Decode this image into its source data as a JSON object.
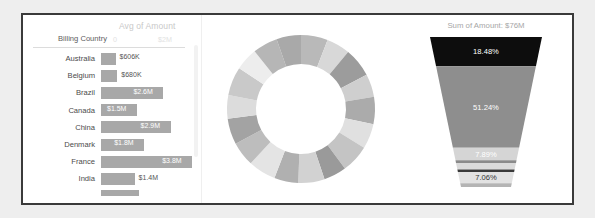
{
  "chart_data": [
    {
      "type": "bar",
      "title": "Avg of Amount",
      "dimension_label": "Billing Country",
      "orientation": "horizontal",
      "xlabel": "",
      "ylabel": "Billing Country",
      "axis_ticks": [
        "0",
        "$2M"
      ],
      "xlim": [
        0,
        4000000
      ],
      "grid": false,
      "categories": [
        "Australia",
        "Belgium",
        "Brazil",
        "Canada",
        "China",
        "Denmark",
        "France",
        "India"
      ],
      "values": [
        606000,
        680000,
        2600000,
        1500000,
        2900000,
        1800000,
        3800000,
        1400000
      ],
      "value_labels": [
        "$606K",
        "$680K",
        "$2.6M",
        "$1.5M",
        "$2.9M",
        "$1.8M",
        "$3.8M",
        "$1.4M"
      ],
      "label_inside": [
        false,
        false,
        true,
        true,
        true,
        true,
        true,
        false
      ],
      "bar_color": "#a8a8a8",
      "clipped_row_value": 1600000
    },
    {
      "type": "pie",
      "title": "",
      "variant": "donut",
      "legend": "none",
      "labels": [],
      "values": [
        5.9,
        5.2,
        6.4,
        5.1,
        6.0,
        5.5,
        6.2,
        5.0,
        5.8,
        5.3,
        6.1,
        5.4,
        5.7,
        5.2,
        6.3,
        5.0,
        5.5,
        5.4
      ],
      "colors": [
        "#b9b9b9",
        "#d8d8d8",
        "#9c9c9c",
        "#cfcfcf",
        "#ababab",
        "#e0e0e0",
        "#c4c4c4",
        "#9a9a9a",
        "#d2d2d2",
        "#b0b0b0",
        "#e4e4e4",
        "#bdbdbd",
        "#a3a3a3",
        "#dcdcdc",
        "#c9c9c9",
        "#ededed",
        "#b6b6b6",
        "#a9a9a9"
      ]
    },
    {
      "type": "bar",
      "variant": "funnel",
      "title": "Sum of Amount: $76M",
      "categories": [
        "stage-1",
        "stage-2",
        "stage-3",
        "stage-4",
        "stage-5",
        "stage-6",
        "stage-7",
        "stage-8"
      ],
      "values": [
        18.48,
        51.24,
        7.89,
        1.6,
        4.2,
        1.5,
        7.06,
        2.4
      ],
      "value_labels": [
        "18.48%",
        "51.24%",
        "7.89%",
        "",
        "",
        "",
        "7.06%",
        ""
      ],
      "colors": [
        "#0d0d0d",
        "#8e8e8e",
        "#d5d5d5",
        "#8a8a8a",
        "#dadada",
        "#3a3a3a",
        "#e2e2e2",
        "#b4b4b4"
      ],
      "label_colors": [
        "#ffffff",
        "#ffffff",
        "#ffffff",
        "",
        "",
        "",
        "#333333",
        ""
      ]
    }
  ],
  "bar_panel": {
    "title": "Avg of Amount",
    "dimension_label": "Billing Country",
    "tick_zero": "0",
    "tick_max": "$2M",
    "rows": [
      {
        "country": "Australia",
        "value_label": "$606K"
      },
      {
        "country": "Belgium",
        "value_label": "$680K"
      },
      {
        "country": "Brazil",
        "value_label": "$2.6M"
      },
      {
        "country": "Canada",
        "value_label": "$1.5M"
      },
      {
        "country": "China",
        "value_label": "$2.9M"
      },
      {
        "country": "Denmark",
        "value_label": "$1.8M"
      },
      {
        "country": "France",
        "value_label": "$3.8M"
      },
      {
        "country": "India",
        "value_label": "$1.4M"
      }
    ]
  },
  "funnel_panel": {
    "title": "Sum of Amount: $76M",
    "segments": [
      {
        "label": "18.48%"
      },
      {
        "label": "51.24%"
      },
      {
        "label": "7.89%"
      },
      {
        "label": "7.06%"
      }
    ]
  },
  "colors": {
    "page_background": "#eeeeee",
    "card_background": "#ffffff",
    "card_border": "#3a3a3a",
    "bar_fill": "#a8a8a8",
    "funnel_dark": "#0d0d0d",
    "funnel_mid": "#8e8e8e",
    "funnel_light": "#d5d5d5"
  }
}
